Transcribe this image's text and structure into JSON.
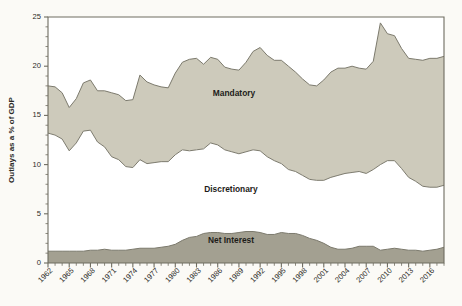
{
  "figure": {
    "background_color": "#fbfaf6",
    "plot_background_color": "#ffffff"
  },
  "axes": {
    "y_axis_title": "Outlays as a % of GDP",
    "y_ticks": [
      "0",
      "5",
      "10",
      "15",
      "20",
      "25"
    ],
    "x_ticks": [
      "1962",
      "1965",
      "1968",
      "1971",
      "1974",
      "1977",
      "1980",
      "1983",
      "1986",
      "1989",
      "1992",
      "1995",
      "1998",
      "2001",
      "2004",
      "2007",
      "2010",
      "2013",
      "2016"
    ]
  },
  "series_labels": {
    "mandatory": "Mandatory",
    "discretionary": "Discretionary",
    "net_interest": "Net Interest"
  },
  "colors": {
    "mandatory_fill": "#cdcabb",
    "discretionary_fill": "#ffffff",
    "net_interest_fill": "#a3a091",
    "line_stroke": "#7c7a6d",
    "axis": "#6e6c60",
    "text": "#2b2a26"
  },
  "chart_data": {
    "type": "area",
    "stacked": true,
    "title": "",
    "subtitle": "",
    "xlabel": "",
    "ylabel": "Outlays as a % of GDP",
    "xlim": [
      1962,
      2018
    ],
    "ylim": [
      0,
      25
    ],
    "grid": false,
    "legend": "inline-labels",
    "x": [
      1962,
      1963,
      1964,
      1965,
      1966,
      1967,
      1968,
      1969,
      1970,
      1971,
      1972,
      1973,
      1974,
      1975,
      1976,
      1977,
      1978,
      1979,
      1980,
      1981,
      1982,
      1983,
      1984,
      1985,
      1986,
      1987,
      1988,
      1989,
      1990,
      1991,
      1992,
      1993,
      1994,
      1995,
      1996,
      1997,
      1998,
      1999,
      2000,
      2001,
      2002,
      2003,
      2004,
      2005,
      2006,
      2007,
      2008,
      2009,
      2010,
      2011,
      2012,
      2013,
      2014,
      2015,
      2016,
      2017,
      2018
    ],
    "series": [
      {
        "name": "Net Interest",
        "values": [
          1.2,
          1.2,
          1.2,
          1.2,
          1.2,
          1.2,
          1.3,
          1.3,
          1.4,
          1.3,
          1.3,
          1.3,
          1.4,
          1.5,
          1.5,
          1.5,
          1.6,
          1.7,
          1.9,
          2.3,
          2.6,
          2.7,
          3.0,
          3.1,
          3.1,
          3.0,
          3.0,
          3.1,
          3.2,
          3.2,
          3.1,
          2.9,
          2.9,
          3.1,
          3.0,
          3.0,
          2.8,
          2.5,
          2.3,
          2.0,
          1.6,
          1.4,
          1.4,
          1.5,
          1.7,
          1.7,
          1.7,
          1.3,
          1.4,
          1.5,
          1.4,
          1.3,
          1.3,
          1.2,
          1.3,
          1.4,
          1.6
        ],
        "color": "#a3a091"
      },
      {
        "name": "Discretionary",
        "values": [
          12.0,
          11.8,
          11.4,
          10.2,
          11.0,
          12.2,
          12.2,
          11.0,
          10.4,
          9.5,
          9.2,
          8.5,
          8.3,
          9.0,
          8.6,
          8.7,
          8.7,
          8.6,
          9.1,
          9.2,
          8.8,
          8.8,
          8.6,
          9.1,
          8.9,
          8.5,
          8.3,
          8.0,
          8.1,
          8.3,
          8.3,
          7.9,
          7.5,
          7.0,
          6.5,
          6.3,
          6.1,
          6.0,
          6.1,
          6.4,
          7.1,
          7.5,
          7.7,
          7.7,
          7.6,
          7.4,
          7.8,
          8.7,
          9.0,
          8.9,
          8.2,
          7.4,
          7.0,
          6.6,
          6.4,
          6.3,
          6.3
        ],
        "color": "#ffffff"
      },
      {
        "name": "Mandatory",
        "values": [
          4.8,
          4.9,
          4.7,
          4.4,
          4.5,
          4.9,
          5.1,
          5.2,
          5.7,
          6.5,
          6.6,
          6.7,
          6.9,
          8.6,
          8.3,
          7.9,
          7.6,
          7.5,
          8.3,
          8.9,
          9.3,
          9.3,
          8.6,
          8.7,
          8.7,
          8.4,
          8.4,
          8.5,
          9.1,
          10.0,
          10.5,
          10.3,
          10.2,
          10.5,
          10.5,
          10.1,
          9.8,
          9.6,
          9.6,
          10.2,
          10.7,
          10.9,
          10.7,
          10.8,
          10.5,
          10.6,
          11.0,
          14.4,
          12.9,
          12.7,
          12.2,
          12.1,
          12.4,
          12.8,
          13.1,
          13.1,
          13.1
        ],
        "color": "#cdcabb"
      }
    ],
    "series_cumulative_top": {
      "net_interest_top": [
        1.2,
        1.2,
        1.2,
        1.2,
        1.2,
        1.2,
        1.3,
        1.3,
        1.4,
        1.3,
        1.3,
        1.3,
        1.4,
        1.5,
        1.5,
        1.5,
        1.6,
        1.7,
        1.9,
        2.3,
        2.6,
        2.7,
        3.0,
        3.1,
        3.1,
        3.0,
        3.0,
        3.1,
        3.2,
        3.2,
        3.1,
        2.9,
        2.9,
        3.1,
        3.0,
        3.0,
        2.8,
        2.5,
        2.3,
        2.0,
        1.6,
        1.4,
        1.4,
        1.5,
        1.7,
        1.7,
        1.7,
        1.3,
        1.4,
        1.5,
        1.4,
        1.3,
        1.3,
        1.2,
        1.3,
        1.4,
        1.6
      ],
      "discretionary_top": [
        13.2,
        13.0,
        12.6,
        11.4,
        12.2,
        13.4,
        13.5,
        12.3,
        11.8,
        10.8,
        10.5,
        9.8,
        9.7,
        10.5,
        10.1,
        10.2,
        10.3,
        10.3,
        11.0,
        11.5,
        11.4,
        11.5,
        11.6,
        12.2,
        12.0,
        11.5,
        11.3,
        11.1,
        11.3,
        11.5,
        11.4,
        10.8,
        10.4,
        10.1,
        9.5,
        9.3,
        8.9,
        8.5,
        8.4,
        8.4,
        8.7,
        8.9,
        9.1,
        9.2,
        9.3,
        9.1,
        9.5,
        10.0,
        10.4,
        10.4,
        9.6,
        8.7,
        8.3,
        7.8,
        7.7,
        7.7,
        7.9
      ],
      "mandatory_top": [
        18.0,
        17.9,
        17.3,
        15.8,
        16.7,
        18.3,
        18.6,
        17.5,
        17.5,
        17.3,
        17.1,
        16.5,
        16.6,
        19.1,
        18.4,
        18.1,
        17.9,
        17.8,
        19.3,
        20.4,
        20.7,
        20.8,
        20.2,
        20.9,
        20.7,
        19.9,
        19.7,
        19.6,
        20.4,
        21.5,
        21.9,
        21.1,
        20.6,
        20.6,
        20.0,
        19.4,
        18.7,
        18.1,
        18.0,
        18.6,
        19.4,
        19.8,
        19.8,
        20.0,
        19.8,
        19.7,
        20.5,
        24.4,
        23.3,
        23.1,
        21.8,
        20.8,
        20.7,
        20.6,
        20.8,
        20.8,
        21.0
      ]
    }
  }
}
